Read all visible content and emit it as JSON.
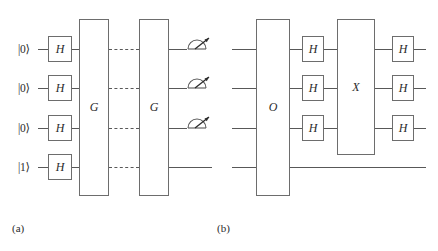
{
  "figure": {
    "caption_a": "(a)",
    "caption_b": "(b)",
    "line_color": "#585858",
    "box_color": "#6d6d6d",
    "text_color": "#2b2b2b",
    "background": "#ffffff"
  },
  "circuit_a": {
    "label": "(a)",
    "qubit_inits": [
      "|0⟩",
      "|0⟩",
      "|0⟩",
      "|1⟩"
    ],
    "hadamards": [
      "H",
      "H",
      "H",
      "H"
    ],
    "oracle_boxes": [
      {
        "label": "G",
        "spans_qubits": 4
      },
      {
        "label": "G",
        "spans_qubits": 4
      }
    ],
    "repeat_connector": "dashed",
    "measurements": [
      "meter-icon",
      "meter-icon",
      "meter-icon"
    ],
    "measured_qubit_count": 3,
    "num_qubits": 4
  },
  "circuit_b": {
    "label": "(b)",
    "num_qubits": 4,
    "oracle_box": {
      "label": "O",
      "spans_qubits": 4
    },
    "hadamards_left": [
      "H",
      "H",
      "H"
    ],
    "conditional_box": {
      "label": "X",
      "spans_qubits": 3
    },
    "hadamards_right": [
      "H",
      "H",
      "H"
    ]
  }
}
